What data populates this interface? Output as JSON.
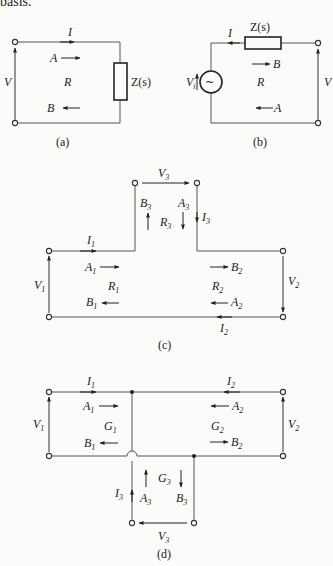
{
  "header_text": "basis.",
  "diagrams": {
    "a": {
      "caption": "(a)",
      "labels": {
        "current": "I",
        "voltage": "V",
        "wave_a": "A",
        "wave_b": "B",
        "reflection": "R",
        "impedance": "Z(s)"
      }
    },
    "b": {
      "caption": "(b)",
      "labels": {
        "current": "I",
        "voltage": "V",
        "source_voltage": "V",
        "source_sub": "i",
        "wave_a": "A",
        "wave_b": "B",
        "reflection": "R",
        "impedance": "Z(s)",
        "source_symbol": "~"
      }
    },
    "c": {
      "caption": "(c)",
      "labels": {
        "I1": [
          "I",
          "1"
        ],
        "I2": [
          "I",
          "2"
        ],
        "I3": [
          "I",
          "3"
        ],
        "V1": [
          "V",
          "1"
        ],
        "V2": [
          "V",
          "2"
        ],
        "V3": [
          "V",
          "3"
        ],
        "A1": [
          "A",
          "1"
        ],
        "A2": [
          "A",
          "2"
        ],
        "A3": [
          "A",
          "3"
        ],
        "B1": [
          "B",
          "1"
        ],
        "B2": [
          "B",
          "2"
        ],
        "B3": [
          "B",
          "3"
        ],
        "R1": [
          "R",
          "1"
        ],
        "R2": [
          "R",
          "2"
        ],
        "R3": [
          "R",
          "3"
        ]
      }
    },
    "d": {
      "caption": "(d)",
      "labels": {
        "I1": [
          "I",
          "1"
        ],
        "I2": [
          "I",
          "2"
        ],
        "I3": [
          "I",
          "3"
        ],
        "V1": [
          "V",
          "1"
        ],
        "V2": [
          "V",
          "2"
        ],
        "V3": [
          "V",
          "3"
        ],
        "A1": [
          "A",
          "1"
        ],
        "A2": [
          "A",
          "2"
        ],
        "A3": [
          "A",
          "3"
        ],
        "B1": [
          "B",
          "1"
        ],
        "B2": [
          "B",
          "2"
        ],
        "B3": [
          "B",
          "3"
        ],
        "G1": [
          "G",
          "1"
        ],
        "G2": [
          "G",
          "2"
        ],
        "G3": [
          "G",
          "3"
        ]
      }
    }
  }
}
